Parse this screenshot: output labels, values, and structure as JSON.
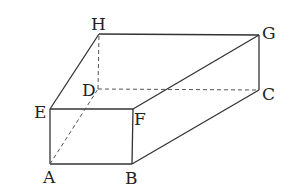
{
  "diagram": {
    "type": "rectangular-prism",
    "vertices": {
      "A": {
        "label": "A",
        "x": 50,
        "y": 164
      },
      "B": {
        "label": "B",
        "x": 132,
        "y": 164
      },
      "C": {
        "label": "C",
        "x": 259,
        "y": 90
      },
      "D": {
        "label": "D",
        "x": 98,
        "y": 89
      },
      "E": {
        "label": "E",
        "x": 50,
        "y": 109
      },
      "F": {
        "label": "F",
        "x": 133,
        "y": 109
      },
      "G": {
        "label": "G",
        "x": 259,
        "y": 35
      },
      "H": {
        "label": "H",
        "x": 99,
        "y": 34
      }
    },
    "solid_edges": [
      "AB",
      "BF",
      "FE",
      "EA",
      "EH",
      "HG",
      "GC",
      "CB",
      "FG"
    ],
    "dashed_edges": [
      "AD",
      "DC",
      "DH"
    ],
    "stroke_color": "#333333"
  }
}
